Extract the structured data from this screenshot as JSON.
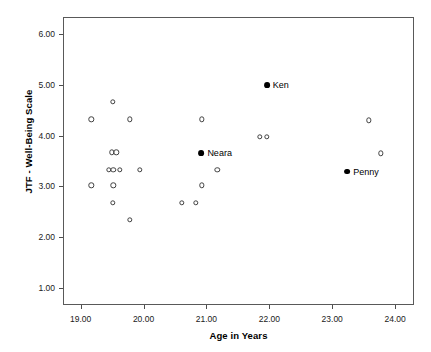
{
  "chart_data": {
    "type": "scatter",
    "title": "",
    "xlabel": "Age in Years",
    "ylabel": "JTF - Well-Being Scale",
    "xlim": [
      18.72,
      24.3
    ],
    "ylim": [
      0.66,
      6.34
    ],
    "grid": false,
    "legend": null,
    "xticks": [
      "19.00",
      "20.00",
      "21.00",
      "22.00",
      "23.00",
      "24.00"
    ],
    "xtick_values": [
      19,
      20,
      21,
      22,
      23,
      24
    ],
    "yticks": [
      "1.00",
      "2.00",
      "3.00",
      "4.00",
      "5.00",
      "6.00"
    ],
    "ytick_values": [
      1,
      2,
      3,
      4,
      5,
      6
    ],
    "series": [
      {
        "name": "unlabeled-participants",
        "marker": "open-circle",
        "color": "#404040",
        "points": [
          {
            "x": 19.17,
            "y": 4.32
          },
          {
            "x": 19.17,
            "y": 3.02
          },
          {
            "x": 19.51,
            "y": 4.67
          },
          {
            "x": 19.5,
            "y": 3.67
          },
          {
            "x": 19.57,
            "y": 3.67
          },
          {
            "x": 19.45,
            "y": 3.33
          },
          {
            "x": 19.52,
            "y": 3.33
          },
          {
            "x": 19.62,
            "y": 3.33
          },
          {
            "x": 19.52,
            "y": 3.02
          },
          {
            "x": 19.51,
            "y": 2.68
          },
          {
            "x": 19.78,
            "y": 4.32
          },
          {
            "x": 19.78,
            "y": 2.34
          },
          {
            "x": 19.94,
            "y": 3.33
          },
          {
            "x": 20.61,
            "y": 2.68
          },
          {
            "x": 20.83,
            "y": 2.68
          },
          {
            "x": 20.93,
            "y": 4.32
          },
          {
            "x": 20.93,
            "y": 3.02
          },
          {
            "x": 21.17,
            "y": 3.33
          },
          {
            "x": 21.85,
            "y": 3.98
          },
          {
            "x": 21.96,
            "y": 3.98
          },
          {
            "x": 23.58,
            "y": 4.3
          },
          {
            "x": 23.77,
            "y": 3.65
          }
        ]
      },
      {
        "name": "highlighted-participants",
        "marker": "filled-circle",
        "color": "#000000",
        "points": [
          {
            "x": 21.96,
            "y": 5.0,
            "label": "Ken"
          },
          {
            "x": 20.92,
            "y": 3.65,
            "label": "Neara"
          },
          {
            "x": 23.24,
            "y": 3.29,
            "label": "Penny"
          }
        ]
      }
    ]
  }
}
